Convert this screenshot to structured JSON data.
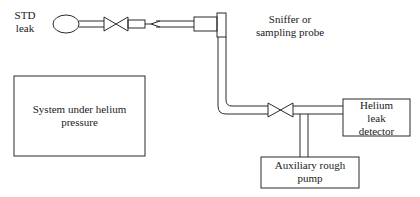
{
  "diagram": {
    "type": "schematic",
    "title": "",
    "labels": {
      "std_leak_line1": "STD",
      "std_leak_line2": "leak",
      "probe_line1": "Sniffer or",
      "probe_line2": "sampling probe",
      "system_line1": "System under helium",
      "system_line2": "pressure",
      "detector_line1": "Helium",
      "detector_line2": "leak",
      "detector_line3": "detector",
      "pump_line1": "Auxiliary rough",
      "pump_line2": "pump"
    },
    "components": [
      {
        "id": "std-leak",
        "shape": "ellipse",
        "label": "STD leak"
      },
      {
        "id": "valve-1",
        "shape": "bowtie-valve",
        "between": [
          "std-leak",
          "probe-tip"
        ]
      },
      {
        "id": "sniffer-probe",
        "shape": "tube-with-tip",
        "label": "Sniffer or sampling probe"
      },
      {
        "id": "system",
        "shape": "rectangle",
        "label": "System under helium pressure"
      },
      {
        "id": "valve-2",
        "shape": "bowtie-valve",
        "between": [
          "sniffer-probe",
          "helium-leak-detector"
        ]
      },
      {
        "id": "helium-leak-detector",
        "shape": "rectangle",
        "label": "Helium leak detector"
      },
      {
        "id": "auxiliary-rough-pump",
        "shape": "rectangle",
        "label": "Auxiliary rough pump"
      }
    ],
    "connections": [
      [
        "std-leak",
        "valve-1"
      ],
      [
        "valve-1",
        "sniffer-probe"
      ],
      [
        "sniffer-probe",
        "valve-2"
      ],
      [
        "valve-2",
        "helium-leak-detector"
      ],
      [
        "helium-leak-detector",
        "auxiliary-rough-pump"
      ]
    ],
    "colors": {
      "line": "#2a2a2a",
      "text": "#1a1a1a",
      "background": "#ffffff"
    }
  }
}
